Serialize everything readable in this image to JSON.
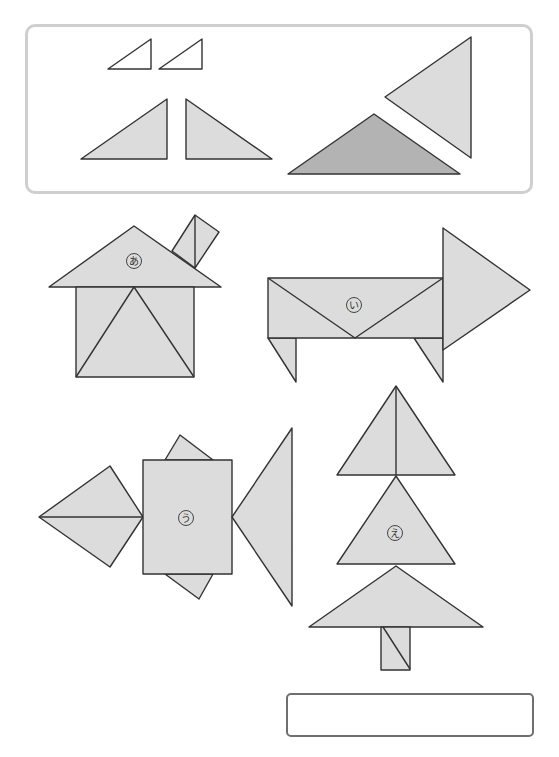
{
  "colors": {
    "light_fill": "#dcdcdc",
    "dark_fill": "#b3b3b3",
    "stroke": "#333333",
    "panel_border": "#cfcfcf"
  },
  "pieces_panel": {
    "pieces": [
      {
        "name": "small-triangle-1",
        "fill": "none",
        "points": "108,69 151,69 151,39"
      },
      {
        "name": "small-triangle-2",
        "fill": "none",
        "points": "159,69 202,69 202,39"
      },
      {
        "name": "medium-triangle-1",
        "fill": "light",
        "points": "81,159 167,159 167,99"
      },
      {
        "name": "medium-triangle-2",
        "fill": "light",
        "points": "186,99 186,159 272,159"
      },
      {
        "name": "large-triangle-dark",
        "fill": "dark",
        "points": "288,174 374,114 460,174"
      },
      {
        "name": "large-triangle-light",
        "fill": "light",
        "points": "385,97 471,37 471,158"
      }
    ]
  },
  "figures": [
    {
      "id": "a",
      "label": "あ"
    },
    {
      "id": "i",
      "label": "い"
    },
    {
      "id": "u",
      "label": "う"
    },
    {
      "id": "e",
      "label": "え"
    }
  ],
  "answer_box": {
    "value": ""
  }
}
